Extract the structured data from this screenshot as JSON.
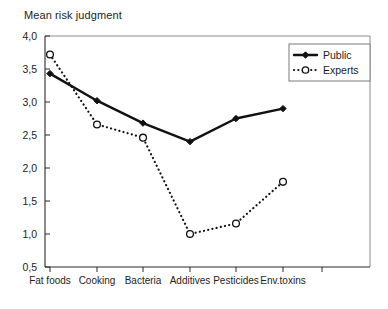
{
  "chart_data": {
    "type": "line",
    "title": "Mean risk judgment",
    "xlabel": "",
    "ylabel": "",
    "categories": [
      "Fat foods",
      "Cooking",
      "Bacteria",
      "Additives",
      "Pesticides",
      "Env.toxins"
    ],
    "series": [
      {
        "name": "Public",
        "values": [
          3.43,
          3.02,
          2.68,
          2.4,
          2.75,
          2.9
        ],
        "line_style": "solid",
        "marker": "filled-diamond",
        "color": "#111111"
      },
      {
        "name": "Experts",
        "values": [
          3.72,
          2.66,
          2.46,
          1.0,
          1.16,
          1.79
        ],
        "line_style": "dotted",
        "marker": "open-circle",
        "color": "#111111"
      }
    ],
    "ylim": [
      0.5,
      4.0
    ],
    "ytick_labels": [
      "4,0",
      "3,5",
      "3,0",
      "2,5",
      "2,0",
      "1,5",
      "1,0",
      "0,5"
    ],
    "ytick_values": [
      4.0,
      3.5,
      3.0,
      2.5,
      2.0,
      1.5,
      1.0,
      0.5
    ],
    "grid": false,
    "legend_position": "top-right",
    "legend_entries": [
      "Public",
      "Experts"
    ]
  }
}
